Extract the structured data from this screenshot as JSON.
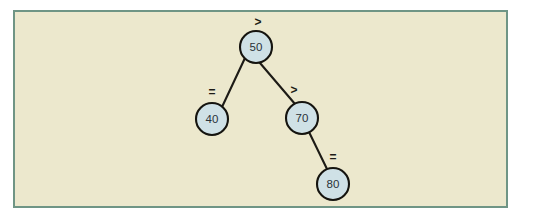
{
  "figure": {
    "kind": "binary-search-tree-diagram",
    "frame": {
      "background_color": "#ece8cd",
      "border_color": "#6f9585",
      "page_background": "#ffffff"
    },
    "style": {
      "node_fill": "#cfe1e6",
      "node_stroke": "#15140f",
      "edge_stroke": "#1d1b16",
      "label_color": "#2a3238"
    }
  },
  "tree": {
    "nodes": [
      {
        "id": "n50",
        "label": "50",
        "cx": 256,
        "cy": 47,
        "r": 16,
        "role": "root"
      },
      {
        "id": "n40",
        "label": "40",
        "cx": 212,
        "cy": 119,
        "r": 16,
        "role": "left-child"
      },
      {
        "id": "n70",
        "label": "70",
        "cx": 302,
        "cy": 118,
        "r": 16,
        "role": "right-child"
      },
      {
        "id": "n80",
        "label": "80",
        "cx": 333,
        "cy": 184,
        "r": 16,
        "role": "right-grandchild"
      }
    ],
    "edges": [
      {
        "id": "e50-40",
        "from": "n50",
        "to": "n40",
        "x1": 245,
        "y1": 58,
        "x2": 222,
        "y2": 107
      },
      {
        "id": "e50-70",
        "from": "n50",
        "to": "n70",
        "x1": 260,
        "y1": 63,
        "x2": 295,
        "y2": 104
      },
      {
        "id": "e70-80",
        "from": "n70",
        "to": "n80",
        "x1": 309,
        "y1": 132,
        "x2": 327,
        "y2": 169
      }
    ],
    "annotations": [
      {
        "id": "a-root",
        "text": ">",
        "x": 258,
        "y": 22,
        "attached_to": "n50"
      },
      {
        "id": "a-left",
        "text": "=",
        "x": 212,
        "y": 92,
        "attached_to": "e50-40"
      },
      {
        "id": "a-right",
        "text": ">",
        "x": 294,
        "y": 90,
        "attached_to": "e50-70"
      },
      {
        "id": "a-leaf",
        "text": "=",
        "x": 333,
        "y": 157,
        "attached_to": "e70-80"
      }
    ]
  }
}
